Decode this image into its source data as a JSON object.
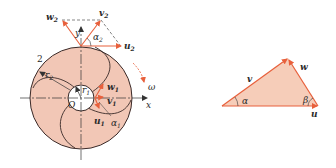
{
  "colors": {
    "impeller_fill": "#f2c7b6",
    "outline": "#3a2a28",
    "arrow": "#e8603c",
    "triangle_fill": "#f6cdb9",
    "axis": "#333333"
  },
  "impeller_diagram": {
    "labels": {
      "w2": "w",
      "w2_sub": "2",
      "v2": "v",
      "v2_sub": "2",
      "u2": "u",
      "u2_sub": "2",
      "alpha2": "α",
      "alpha2_sub": "2",
      "y_axis": "y",
      "x_axis": "x",
      "omega": "ω",
      "outlet_marker": "2",
      "r2": "r",
      "r2_sub": "2",
      "r1": "r",
      "r1_sub": "1",
      "origin": "O",
      "w1": "w",
      "w1_sub": "1",
      "v1": "v",
      "v1_sub": "1",
      "u1": "u",
      "u1_sub": "1",
      "alpha1": "α",
      "alpha1_sub": "1"
    }
  },
  "velocity_triangle": {
    "labels": {
      "v": "v",
      "w": "w",
      "u": "u",
      "alpha": "α",
      "beta": "β"
    }
  }
}
